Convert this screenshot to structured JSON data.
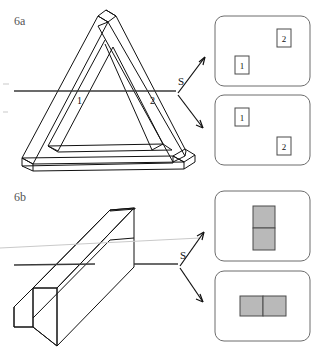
{
  "figure": {
    "panel_a_label": "6a",
    "panel_b_label": "6b",
    "section_label_a": "S",
    "section_label_b": "S",
    "edge_label_1": "1",
    "edge_label_2": "2"
  },
  "panel_a": {
    "object": "penrose-impossible-triangle",
    "section_line_label": "S",
    "marks": [
      {
        "name": "mark-1",
        "label": "1"
      },
      {
        "name": "mark-2",
        "label": "2"
      }
    ],
    "interpretations": [
      {
        "name": "interpretation-top",
        "items": [
          {
            "label": "2",
            "position": "top-right"
          },
          {
            "label": "1",
            "position": "center-left"
          }
        ]
      },
      {
        "name": "interpretation-bottom",
        "items": [
          {
            "label": "1",
            "position": "top-left"
          },
          {
            "label": "2",
            "position": "bottom-right"
          }
        ]
      }
    ]
  },
  "panel_b": {
    "object": "rectangular-beam",
    "section_line_label": "S",
    "interpretations": [
      {
        "name": "interpretation-top",
        "layout": "stacked-vertical",
        "cells": 2
      },
      {
        "name": "interpretation-bottom",
        "layout": "side-by-side-horizontal",
        "cells": 2
      }
    ]
  },
  "colors": {
    "ink": "#111111",
    "panel_border": "#6d6d6d",
    "cell_fill": "#b9b9b9",
    "cell_border": "#4a4a4a",
    "faint_line": "#c9c9c9",
    "background": "#ffffff"
  }
}
